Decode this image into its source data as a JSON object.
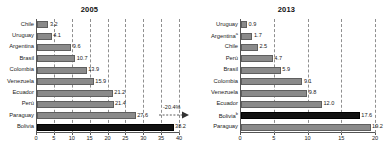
{
  "chart_data": [
    {
      "type": "bar",
      "orientation": "horizontal",
      "title": "2005",
      "xlabel": "",
      "ylabel": "",
      "xlim": [
        0,
        40
      ],
      "xticks": [
        0,
        5,
        10,
        15,
        20,
        25,
        30,
        35,
        40
      ],
      "grid": true,
      "grid_style": "dashed-vertical",
      "legend": "none",
      "categories": [
        "Chile",
        "Uruguay",
        "Argentina",
        "Brasil",
        "Colombia",
        "Venezuela",
        "Ecuador",
        "Perú",
        "Paraguay",
        "Bolivia"
      ],
      "values": [
        3.2,
        4.1,
        9.6,
        10.7,
        13.9,
        15.9,
        21.2,
        21.4,
        27.6,
        38.2
      ],
      "value_labels": [
        "3.2",
        "4.1",
        "9.6",
        "10.7",
        "13.9",
        "15.9",
        "21.2",
        "21.4",
        "27.6",
        "38.2"
      ],
      "highlight_category": "Bolivia",
      "highlight_color": "#111111",
      "bar_color": "#8a8a8a",
      "annotation": "-20.4%"
    },
    {
      "type": "bar",
      "orientation": "horizontal",
      "title": "2013",
      "xlabel": "",
      "ylabel": "",
      "xlim": [
        0,
        20
      ],
      "xticks": [
        0,
        5,
        10,
        15,
        20
      ],
      "grid": true,
      "grid_style": "dashed-vertical",
      "legend": "none",
      "categories": [
        "Uruguay",
        "Argentina",
        "Chile",
        "Perú",
        "Brasil",
        "Colombia",
        "Venezuela",
        "Ecuador",
        "Bolivia",
        "Paraguay"
      ],
      "category_superscripts": [
        "",
        "a",
        "",
        "",
        "",
        "",
        "",
        "",
        "b",
        ""
      ],
      "values": [
        0.9,
        1.7,
        2.5,
        4.7,
        5.9,
        9.1,
        9.8,
        12.0,
        17.6,
        19.2
      ],
      "value_labels": [
        "0.9",
        "1.7",
        "2.5",
        "4.7",
        "5.9",
        "9.1",
        "9.8",
        "12.0",
        "17.6",
        "19.2"
      ],
      "highlight_category": "Bolivia",
      "highlight_color": "#111111",
      "bar_color": "#8a8a8a"
    }
  ],
  "left_chart": {
    "title": "2005",
    "annotation": "-20.4%",
    "rows": [
      {
        "label": "Chile",
        "value": "3.2"
      },
      {
        "label": "Uruguay",
        "value": "4.1"
      },
      {
        "label": "Argentina",
        "value": "9.6"
      },
      {
        "label": "Brasil",
        "value": "10.7"
      },
      {
        "label": "Colombia",
        "value": "13.9"
      },
      {
        "label": "Venezuela",
        "value": "15.9"
      },
      {
        "label": "Ecuador",
        "value": "21.2"
      },
      {
        "label": "Perú",
        "value": "21.4"
      },
      {
        "label": "Paraguay",
        "value": "27.6"
      },
      {
        "label": "Bolivia",
        "value": "38.2"
      }
    ],
    "xticks": [
      "0",
      "5",
      "10",
      "15",
      "20",
      "25",
      "30",
      "35",
      "40"
    ]
  },
  "right_chart": {
    "title": "2013",
    "rows": [
      {
        "label": "Uruguay",
        "sup": "",
        "value": "0.9"
      },
      {
        "label": "Argentina",
        "sup": "a",
        "value": "1.7"
      },
      {
        "label": "Chile",
        "sup": "",
        "value": "2.5"
      },
      {
        "label": "Perú",
        "sup": "",
        "value": "4.7"
      },
      {
        "label": "Brasil",
        "sup": "",
        "value": "5.9"
      },
      {
        "label": "Colombia",
        "sup": "",
        "value": "9.1"
      },
      {
        "label": "Venezuela",
        "sup": "",
        "value": "9.8"
      },
      {
        "label": "Ecuador",
        "sup": "",
        "value": "12.0"
      },
      {
        "label": "Bolivia",
        "sup": "b",
        "value": "17.6"
      },
      {
        "label": "Paraguay",
        "sup": "",
        "value": "19.2"
      }
    ],
    "xticks": [
      "0",
      "5",
      "10",
      "15",
      "20"
    ]
  }
}
